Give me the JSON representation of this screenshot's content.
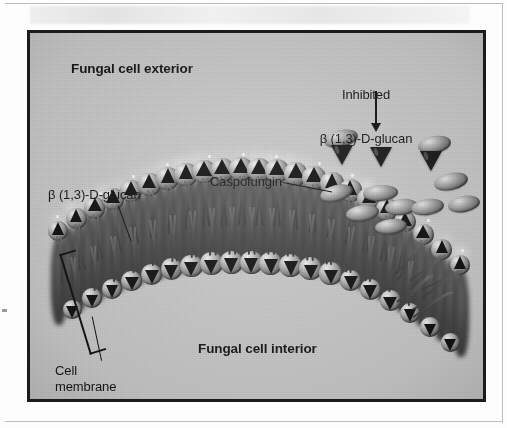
{
  "figure": {
    "type": "scientific-illustration",
    "background_color": "#c9c9c9",
    "frame_color": "#1b1b1b",
    "labels": {
      "exterior": "Fungal cell exterior",
      "interior": "Fungal cell interior",
      "inhibited_line1": "Inhibited",
      "inhibited_line2": "β (1,3)-D-glucan",
      "caspofungin": "Caspofungin",
      "glucan_left": "β (1,3)-D-glucan",
      "cell_membrane": "Cell\nmembrane"
    },
    "annotations": {
      "arrow_inhibited_target": "inhibited-glucan-cone",
      "leader_caspofungin_target": "caspofungin-oval",
      "leader_glucan_target": "membrane-glucan-head",
      "bracket_target": "lipid-bilayer"
    },
    "elements": {
      "free_caspofungin_count": 10,
      "free_inhibited_glucan_count": 3,
      "outer_leaflet_lipid_count": 23,
      "inner_leaflet_lipid_count": 20
    }
  }
}
